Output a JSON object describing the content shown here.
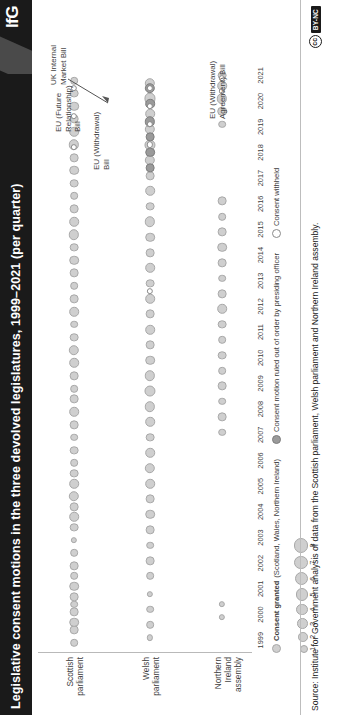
{
  "header": {
    "title": "Legislative consent motions in the three devolved legislatures, 1999–2021 (per quarter)",
    "logo": "IfG"
  },
  "footer": {
    "source": "Source: Institute for Government analysis of data from the Scottish parliament, Welsh parliament and Northern Ireland assembly.",
    "license_mark": "cc",
    "license_badge": "BY-NC"
  },
  "legend": {
    "granted_label": "Consent granted",
    "granted_scope": "(Scotland, Wales, Northern Ireland)",
    "ruled_label": "Consent motion ruled out of order by presiding officer",
    "withheld_label": "Consent withheld",
    "size_numbers": [
      "1",
      "2",
      "3",
      "4",
      "5",
      "6",
      "7",
      "8"
    ],
    "colors": {
      "granted": "#cfcfcf",
      "ruled": "#9a9a9a",
      "withheld": "#ffffff",
      "stroke": "#8a8a8a"
    }
  },
  "annotations": [
    {
      "id": "eu-future-relationship",
      "text": "EU (Future\nRelationship)\nBill",
      "x": 583,
      "y": 22
    },
    {
      "id": "uk-internal-market",
      "text": "UK Internal\nMarket Bill",
      "x": 630,
      "y": 17
    },
    {
      "id": "eu-withdrawal",
      "text": "EU (Withdrawal)\nBill",
      "x": 545,
      "y": 60
    },
    {
      "id": "eu-withdrawal-agreement",
      "text": "EU (Withdrawal)\nAgreement) Bill",
      "x": 596,
      "y": 176
    }
  ],
  "chart_data": {
    "type": "scatter",
    "title": "Legislative consent motions in the three devolved legislatures, 1999–2021 (per quarter)",
    "xlabel": "",
    "ylabel": "",
    "xlim": [
      1999,
      2021.75
    ],
    "grid": false,
    "legend_position": "bottom-left",
    "size_encodes": "number of legislative consent motions per quarter",
    "size_range": [
      1,
      8
    ],
    "categories": [
      "Scottish parliament",
      "Welsh parliament",
      "Northern Ireland assembly"
    ],
    "tick_labels": [
      "1999",
      "2000",
      "2001",
      "2002",
      "2003",
      "2004",
      "2005",
      "2006",
      "2007",
      "2008",
      "2009",
      "2010",
      "2011",
      "2012",
      "2013",
      "2014",
      "2015",
      "2016",
      "2017",
      "2018",
      "2019",
      "2020",
      "2021"
    ],
    "series": [
      {
        "name": "Consent granted",
        "color": "#cfcfcf",
        "points": [
          {
            "row": 0,
            "x": 1999.4,
            "v": 2
          },
          {
            "row": 0,
            "x": 1999.9,
            "v": 3
          },
          {
            "row": 0,
            "x": 2000.2,
            "v": 4
          },
          {
            "row": 0,
            "x": 2000.6,
            "v": 3
          },
          {
            "row": 0,
            "x": 2000.9,
            "v": 2
          },
          {
            "row": 0,
            "x": 2001.2,
            "v": 3
          },
          {
            "row": 0,
            "x": 2001.6,
            "v": 4
          },
          {
            "row": 0,
            "x": 2002.0,
            "v": 2
          },
          {
            "row": 0,
            "x": 2002.4,
            "v": 3
          },
          {
            "row": 0,
            "x": 2002.9,
            "v": 2
          },
          {
            "row": 0,
            "x": 2003.4,
            "v": 1
          },
          {
            "row": 0,
            "x": 2003.9,
            "v": 3
          },
          {
            "row": 0,
            "x": 2004.3,
            "v": 4
          },
          {
            "row": 0,
            "x": 2004.7,
            "v": 3
          },
          {
            "row": 0,
            "x": 2005.1,
            "v": 5
          },
          {
            "row": 0,
            "x": 2005.6,
            "v": 4
          },
          {
            "row": 0,
            "x": 2006.0,
            "v": 3
          },
          {
            "row": 0,
            "x": 2006.4,
            "v": 2
          },
          {
            "row": 0,
            "x": 2006.9,
            "v": 3
          },
          {
            "row": 0,
            "x": 2007.4,
            "v": 2
          },
          {
            "row": 0,
            "x": 2007.9,
            "v": 3
          },
          {
            "row": 0,
            "x": 2008.4,
            "v": 4
          },
          {
            "row": 0,
            "x": 2008.9,
            "v": 3
          },
          {
            "row": 0,
            "x": 2009.3,
            "v": 2
          },
          {
            "row": 0,
            "x": 2009.8,
            "v": 3
          },
          {
            "row": 0,
            "x": 2010.3,
            "v": 4
          },
          {
            "row": 0,
            "x": 2010.8,
            "v": 5
          },
          {
            "row": 0,
            "x": 2011.3,
            "v": 3
          },
          {
            "row": 0,
            "x": 2011.8,
            "v": 2
          },
          {
            "row": 0,
            "x": 2012.3,
            "v": 4
          },
          {
            "row": 0,
            "x": 2012.8,
            "v": 3
          },
          {
            "row": 0,
            "x": 2013.3,
            "v": 2
          },
          {
            "row": 0,
            "x": 2013.8,
            "v": 3
          },
          {
            "row": 0,
            "x": 2014.3,
            "v": 4
          },
          {
            "row": 0,
            "x": 2014.8,
            "v": 3
          },
          {
            "row": 0,
            "x": 2015.3,
            "v": 5
          },
          {
            "row": 0,
            "x": 2015.8,
            "v": 4
          },
          {
            "row": 0,
            "x": 2016.3,
            "v": 3
          },
          {
            "row": 0,
            "x": 2016.8,
            "v": 2
          },
          {
            "row": 0,
            "x": 2017.3,
            "v": 3
          },
          {
            "row": 0,
            "x": 2017.8,
            "v": 4
          },
          {
            "row": 0,
            "x": 2018.3,
            "v": 3
          },
          {
            "row": 0,
            "x": 2018.8,
            "v": 5
          },
          {
            "row": 0,
            "x": 2019.3,
            "v": 4
          },
          {
            "row": 0,
            "x": 2019.8,
            "v": 3
          },
          {
            "row": 0,
            "x": 2020.3,
            "v": 4
          },
          {
            "row": 0,
            "x": 2020.8,
            "v": 3
          },
          {
            "row": 0,
            "x": 2021.3,
            "v": 2
          },
          {
            "row": 1,
            "x": 1999.6,
            "v": 1
          },
          {
            "row": 1,
            "x": 2000.1,
            "v": 2
          },
          {
            "row": 1,
            "x": 2000.7,
            "v": 2
          },
          {
            "row": 1,
            "x": 2001.3,
            "v": 1
          },
          {
            "row": 1,
            "x": 2002.0,
            "v": 2
          },
          {
            "row": 1,
            "x": 2002.6,
            "v": 3
          },
          {
            "row": 1,
            "x": 2003.2,
            "v": 2
          },
          {
            "row": 1,
            "x": 2003.8,
            "v": 3
          },
          {
            "row": 1,
            "x": 2004.4,
            "v": 4
          },
          {
            "row": 1,
            "x": 2005.0,
            "v": 3
          },
          {
            "row": 1,
            "x": 2005.6,
            "v": 4
          },
          {
            "row": 1,
            "x": 2006.2,
            "v": 5
          },
          {
            "row": 1,
            "x": 2006.8,
            "v": 4
          },
          {
            "row": 1,
            "x": 2007.4,
            "v": 3
          },
          {
            "row": 1,
            "x": 2008.0,
            "v": 4
          },
          {
            "row": 1,
            "x": 2008.6,
            "v": 5
          },
          {
            "row": 1,
            "x": 2009.2,
            "v": 6
          },
          {
            "row": 1,
            "x": 2009.8,
            "v": 5
          },
          {
            "row": 1,
            "x": 2010.4,
            "v": 4
          },
          {
            "row": 1,
            "x": 2011.0,
            "v": 3
          },
          {
            "row": 1,
            "x": 2011.6,
            "v": 4
          },
          {
            "row": 1,
            "x": 2012.2,
            "v": 3
          },
          {
            "row": 1,
            "x": 2012.8,
            "v": 4
          },
          {
            "row": 1,
            "x": 2013.4,
            "v": 3
          },
          {
            "row": 1,
            "x": 2014.0,
            "v": 4
          },
          {
            "row": 1,
            "x": 2014.6,
            "v": 3
          },
          {
            "row": 1,
            "x": 2015.2,
            "v": 4
          },
          {
            "row": 1,
            "x": 2015.8,
            "v": 5
          },
          {
            "row": 1,
            "x": 2016.4,
            "v": 3
          },
          {
            "row": 1,
            "x": 2017.0,
            "v": 4
          },
          {
            "row": 1,
            "x": 2017.6,
            "v": 3
          },
          {
            "row": 1,
            "x": 2018.2,
            "v": 5
          },
          {
            "row": 1,
            "x": 2018.8,
            "v": 6
          },
          {
            "row": 1,
            "x": 2019.4,
            "v": 5
          },
          {
            "row": 1,
            "x": 2020.0,
            "v": 4
          },
          {
            "row": 1,
            "x": 2020.6,
            "v": 6
          },
          {
            "row": 1,
            "x": 2021.2,
            "v": 5
          },
          {
            "row": 2,
            "x": 2000.4,
            "v": 1
          },
          {
            "row": 2,
            "x": 2000.9,
            "v": 1
          },
          {
            "row": 2,
            "x": 2007.6,
            "v": 2
          },
          {
            "row": 2,
            "x": 2008.2,
            "v": 3
          },
          {
            "row": 2,
            "x": 2008.8,
            "v": 2
          },
          {
            "row": 2,
            "x": 2009.4,
            "v": 3
          },
          {
            "row": 2,
            "x": 2010.0,
            "v": 2
          },
          {
            "row": 2,
            "x": 2010.6,
            "v": 3
          },
          {
            "row": 2,
            "x": 2011.2,
            "v": 2
          },
          {
            "row": 2,
            "x": 2011.8,
            "v": 3
          },
          {
            "row": 2,
            "x": 2012.4,
            "v": 4
          },
          {
            "row": 2,
            "x": 2013.0,
            "v": 3
          },
          {
            "row": 2,
            "x": 2013.6,
            "v": 2
          },
          {
            "row": 2,
            "x": 2014.2,
            "v": 3
          },
          {
            "row": 2,
            "x": 2014.8,
            "v": 4
          },
          {
            "row": 2,
            "x": 2015.4,
            "v": 3
          },
          {
            "row": 2,
            "x": 2016.0,
            "v": 2
          },
          {
            "row": 2,
            "x": 2016.6,
            "v": 3
          },
          {
            "row": 2,
            "x": 2019.6,
            "v": 2
          },
          {
            "row": 2,
            "x": 2020.1,
            "v": 4
          },
          {
            "row": 2,
            "x": 2020.6,
            "v": 5
          },
          {
            "row": 2,
            "x": 2021.1,
            "v": 4
          },
          {
            "row": 2,
            "x": 2021.5,
            "v": 3
          }
        ]
      },
      {
        "name": "Consent motion ruled out of order by presiding officer",
        "color": "#9a9a9a",
        "points": [
          {
            "row": 1,
            "x": 2017.9,
            "v": 3
          },
          {
            "row": 1,
            "x": 2018.5,
            "v": 4
          },
          {
            "row": 1,
            "x": 2019.1,
            "v": 3
          },
          {
            "row": 1,
            "x": 2019.7,
            "v": 5
          },
          {
            "row": 1,
            "x": 2020.4,
            "v": 4
          },
          {
            "row": 1,
            "x": 2021.0,
            "v": 5
          }
        ]
      },
      {
        "name": "Consent withheld",
        "color": "#ffffff",
        "points": [
          {
            "row": 0,
            "x": 2018.7,
            "v": 1
          },
          {
            "row": 0,
            "x": 2019.9,
            "v": 1
          },
          {
            "row": 0,
            "x": 2021.0,
            "v": 1
          },
          {
            "row": 1,
            "x": 2013.1,
            "v": 1
          },
          {
            "row": 1,
            "x": 2018.8,
            "v": 1
          },
          {
            "row": 1,
            "x": 2019.6,
            "v": 1
          },
          {
            "row": 1,
            "x": 2020.3,
            "v": 1
          },
          {
            "row": 1,
            "x": 2021.0,
            "v": 1
          },
          {
            "row": 2,
            "x": 2020.9,
            "v": 1
          },
          {
            "row": 2,
            "x": 2021.4,
            "v": 1
          }
        ]
      }
    ]
  }
}
